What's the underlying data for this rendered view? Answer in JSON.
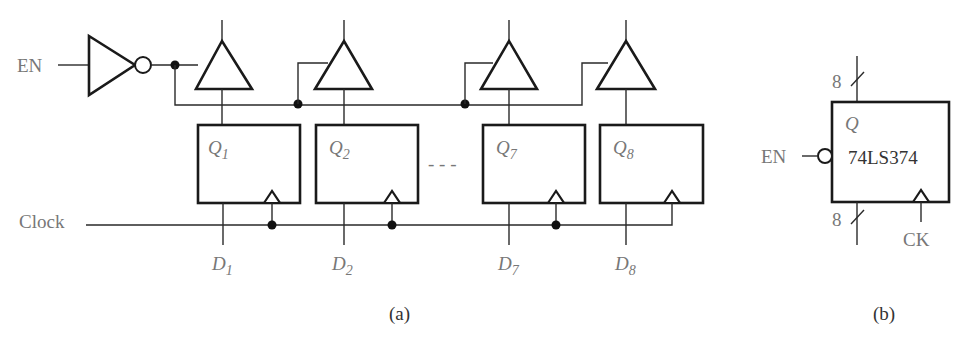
{
  "figure": {
    "part_a": {
      "caption": "(a)",
      "enable_label": "EN",
      "clock_label": "Clock",
      "registers": [
        {
          "q_label": "Q",
          "q_sub": "1",
          "d_label": "D",
          "d_sub": "1"
        },
        {
          "q_label": "Q",
          "q_sub": "2",
          "d_label": "D",
          "d_sub": "2"
        },
        {
          "q_label": "Q",
          "q_sub": "7",
          "d_label": "D",
          "d_sub": "7"
        },
        {
          "q_label": "Q",
          "q_sub": "8",
          "d_label": "D",
          "d_sub": "8"
        }
      ],
      "ellipsis": "- - -"
    },
    "part_b": {
      "caption": "(b)",
      "chip_name": "74LS374",
      "output_label": "Q",
      "enable_label": "EN",
      "clock_label": "CK",
      "bus_width_top": "8",
      "bus_width_bottom": "8"
    }
  }
}
